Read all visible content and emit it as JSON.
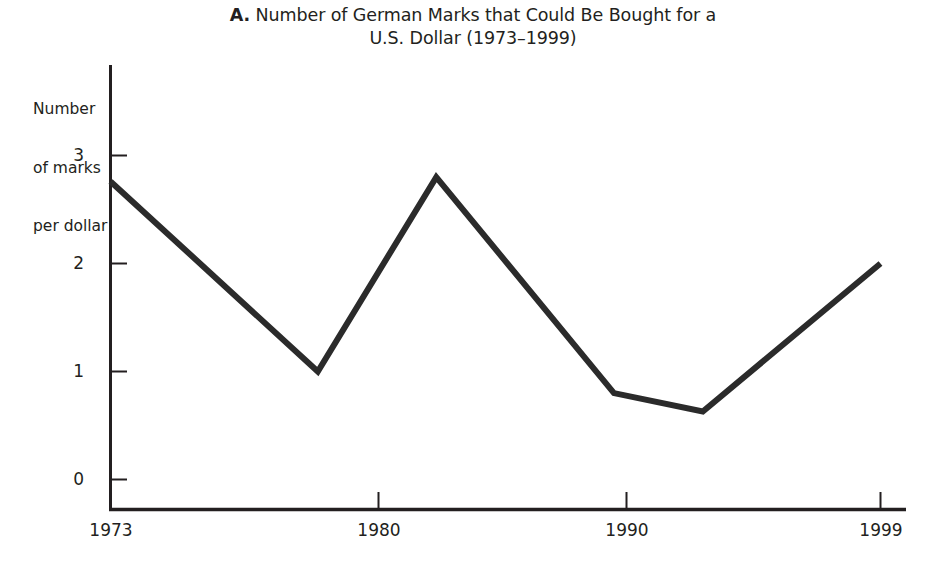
{
  "chart_data": {
    "type": "line",
    "title": "A. Number of German Marks that Could Be Bought for a U.S. Dollar (1973–1999)",
    "title_panel_letter": "A.",
    "title_line1": "Number of German Marks that Could Be Bought for a",
    "title_line2": "U.S. Dollar (1973–1999)",
    "xlabel": "",
    "ylabel": "Number of marks per dollar",
    "ylabel_line1": "Number",
    "ylabel_line2": "of marks",
    "ylabel_line3": "per dollar",
    "x": [
      1973,
      1980,
      1984,
      1990,
      1993,
      1999
    ],
    "values": [
      2.76,
      1.0,
      2.8,
      0.8,
      0.63,
      2.0
    ],
    "series": [
      {
        "name": "Marks per dollar",
        "values": [
          2.76,
          1.0,
          2.8,
          0.8,
          0.63,
          2.0
        ]
      }
    ],
    "xlim": [
      1973,
      1999
    ],
    "ylim": [
      0,
      3
    ],
    "y_ticks": [
      "0",
      "1",
      "2",
      "3"
    ],
    "y_tick_values": [
      0,
      1,
      2,
      3
    ],
    "x_ticks": [
      "1973",
      "1980",
      "1990",
      "1999"
    ],
    "x_tick_values": [
      1973,
      1980,
      1990,
      1999
    ],
    "grid": false,
    "legend": false,
    "legend_position": "none",
    "line_color": "#2b2b2b",
    "line_width": 6,
    "axis_color": "#231f20",
    "background_color": "#ffffff"
  }
}
